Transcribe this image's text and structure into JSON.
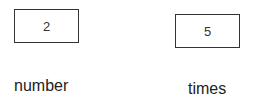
{
  "boxes": [
    {
      "id": "number",
      "value": "2"
    },
    {
      "id": "times",
      "value": "5"
    }
  ],
  "labels": {
    "number": "number",
    "times": "times"
  }
}
